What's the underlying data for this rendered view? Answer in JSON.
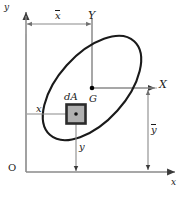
{
  "figure": {
    "background": "#ffffff",
    "width": 184,
    "height": 197
  },
  "colors": {
    "outline": "#1a1a1a",
    "dimension_line": "#8a8a8a",
    "axis": "#8a8a8a",
    "element_fill": "#b0b0b0",
    "element_border": "#2b2b2b",
    "point": "#000000"
  },
  "axes": {
    "reference": {
      "x_label": "x",
      "y_label": "y",
      "origin_label": "O"
    },
    "centroidal": {
      "x_label": "X",
      "y_label": "Y",
      "centroid_label": "G"
    }
  },
  "labels": {
    "x_bar": "x",
    "y_bar": "y",
    "x_small": "x",
    "y_small": "y",
    "element": "dA"
  },
  "shape": {
    "type": "ellipse",
    "centroid": {
      "x": 92,
      "y": 88
    },
    "semi_major": 63,
    "semi_minor": 34,
    "rotation_deg": -48
  },
  "element": {
    "name": "dA",
    "center": {
      "x": 76,
      "y": 114
    },
    "size": 19
  },
  "dimensions": [
    {
      "name": "x-bar",
      "label": "x",
      "overbar": true,
      "orientation": "horizontal",
      "from": {
        "x": 26,
        "y": 24
      },
      "to": {
        "x": 92,
        "y": 24
      }
    },
    {
      "name": "y-bar",
      "label": "y",
      "overbar": true,
      "orientation": "vertical",
      "from": {
        "x": 148,
        "y": 88
      },
      "to": {
        "x": 148,
        "y": 172
      }
    },
    {
      "name": "x-small",
      "label": "x",
      "overbar": false,
      "orientation": "horizontal",
      "from": {
        "x": 26,
        "y": 114
      },
      "to": {
        "x": 76,
        "y": 114
      }
    },
    {
      "name": "y-small",
      "label": "y",
      "overbar": false,
      "orientation": "vertical",
      "from": {
        "x": 76,
        "y": 114
      },
      "to": {
        "x": 76,
        "y": 172
      }
    }
  ]
}
